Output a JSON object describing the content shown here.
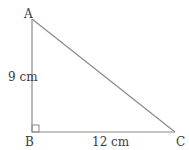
{
  "diagram": {
    "type": "right-triangle",
    "vertices": {
      "A": {
        "label": "A"
      },
      "B": {
        "label": "B"
      },
      "C": {
        "label": "C"
      }
    },
    "sides": {
      "AB": {
        "label": "9 cm"
      },
      "BC": {
        "label": "12 cm"
      }
    },
    "right_angle_at": "B",
    "stroke_color": "#8a8a8a",
    "text_color": "#3a3a3a"
  }
}
